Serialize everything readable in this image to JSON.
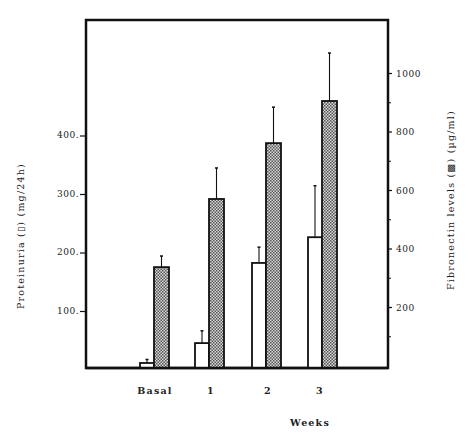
{
  "chart_data": {
    "type": "bar",
    "title": "",
    "categories": [
      "Basal",
      "1",
      "2",
      "3"
    ],
    "xlabel": "Weeks",
    "ylabel": "Proteinuria (▯) (mg/24h)",
    "ylabel_right": "Fibronectin levels (▩) (µg/ml)",
    "series": [
      {
        "name": "Proteinuria",
        "axis": "left",
        "unit": "mg/24h",
        "style": "open",
        "values": [
          12,
          46,
          183,
          227
        ],
        "error_upper": [
          18,
          67,
          210,
          315
        ]
      },
      {
        "name": "Fibronectin levels",
        "axis": "right",
        "unit": "µg/ml",
        "style": "hatched",
        "values": [
          338,
          571,
          762,
          906
        ],
        "error_upper": [
          376,
          677,
          885,
          1070
        ]
      }
    ],
    "left_axis": {
      "ticks": [
        100,
        200,
        300,
        400
      ],
      "ylim": [
        0,
        600
      ]
    },
    "right_axis": {
      "ticks": [
        200,
        400,
        600,
        800,
        1000
      ],
      "minor_ticks": [
        100,
        300,
        500,
        700,
        900
      ],
      "ylim": [
        0,
        1170
      ]
    },
    "grid": false,
    "legend": "none (symbols embedded in axis titles)"
  },
  "labels": {
    "x_axis_title": "Weeks",
    "left_axis_title": "Proteinuria (▯) (mg/24h)",
    "right_axis_title": "Fibronectin levels (▩) (µg/ml)"
  },
  "colors": {
    "ink": "#111111",
    "open_fill": "#ffffff",
    "hatch_dark": "#555555",
    "hatch_light": "#d8d8d8"
  }
}
